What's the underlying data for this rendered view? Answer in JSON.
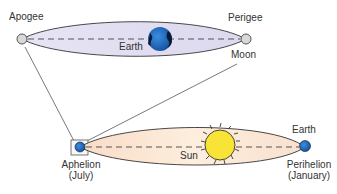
{
  "top_orbit": {
    "apogee_label": "Apogee",
    "perigee_label": "Perigee",
    "earth_label": "Earth",
    "moon_label": "Moon",
    "fill_color": "#e4e1f2"
  },
  "bottom_orbit": {
    "sun_label": "Sun",
    "earth_label": "Earth",
    "aphelion_label": "Aphelion",
    "aphelion_month": "(July)",
    "perihelion_label": "Perihelion",
    "perihelion_month": "(January)",
    "fill_color": "#fbe6d6",
    "sun_color": "#f7e437"
  }
}
